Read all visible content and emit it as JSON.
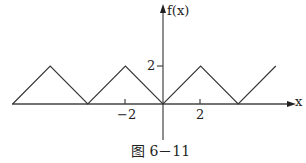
{
  "chart_data": {
    "type": "line",
    "title": "",
    "caption": "图 6－11",
    "xlabel": "x",
    "ylabel": "f(x)",
    "x_ticks": [
      {
        "value": -2,
        "label": "-2"
      },
      {
        "value": 2,
        "label": "2"
      }
    ],
    "y_ticks": [
      {
        "value": 2,
        "label": "2"
      }
    ],
    "series": [
      {
        "name": "f(x)",
        "x": [
          -8,
          -6,
          -4,
          -2,
          0,
          2,
          4,
          6
        ],
        "y": [
          0,
          2,
          0,
          2,
          0,
          2,
          0,
          2
        ]
      }
    ],
    "xlim": [
      -8,
      7
    ],
    "ylim": [
      -2,
      5
    ],
    "grid": false,
    "legend": "none"
  },
  "labels": {
    "y_axis": "f(x)",
    "x_axis": "x",
    "y_tick_2": "2",
    "x_tick_neg2": "−2",
    "x_tick_2": "2",
    "caption": "图 6－11"
  },
  "colors": {
    "line": "#333333",
    "axis": "#444444"
  }
}
